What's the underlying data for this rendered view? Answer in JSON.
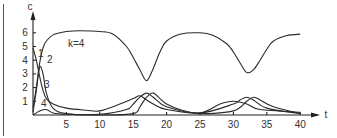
{
  "chart_data": {
    "type": "line",
    "title": "",
    "annotation": "k=4",
    "xlabel": "t",
    "ylabel": "c",
    "xlim": [
      0,
      41
    ],
    "ylim": [
      0,
      6.8
    ],
    "x_ticks": [
      "5",
      "10",
      "15",
      "20",
      "25",
      "30",
      "35",
      "40"
    ],
    "y_ticks": [
      "1",
      "2",
      "3",
      "4",
      "5",
      "6"
    ],
    "grid": false,
    "legend": "none",
    "curve_labels": [
      "1",
      "2",
      "3",
      "4"
    ],
    "series": [
      {
        "name": "curve-1 (dominant)",
        "x": [
          0,
          0.5,
          1,
          1.5,
          2,
          3,
          4,
          5,
          7,
          10,
          12,
          14,
          15,
          16,
          17,
          18,
          19,
          20,
          22,
          25,
          27,
          29,
          30,
          31,
          32,
          33,
          34,
          35,
          36,
          38,
          40
        ],
        "values": [
          0.5,
          2.0,
          3.8,
          4.9,
          5.4,
          5.85,
          6.0,
          6.1,
          6.15,
          6.1,
          5.9,
          5.0,
          4.2,
          3.3,
          2.5,
          3.4,
          4.6,
          5.4,
          5.9,
          6.0,
          5.8,
          5.2,
          4.6,
          3.8,
          3.1,
          3.3,
          4.0,
          4.8,
          5.4,
          5.8,
          5.9
        ]
      },
      {
        "name": "curve-2",
        "x": [
          0,
          0.5,
          1,
          1.5,
          2,
          3,
          5,
          10,
          14,
          15,
          16,
          17,
          18,
          20,
          25,
          30,
          31,
          32,
          33,
          35,
          40
        ],
        "values": [
          0.2,
          1.8,
          3.5,
          3.0,
          1.6,
          0.5,
          0.1,
          0.05,
          0.4,
          0.8,
          1.3,
          1.6,
          1.3,
          0.6,
          0.15,
          0.8,
          1.1,
          1.3,
          1.1,
          0.5,
          0.1
        ]
      },
      {
        "name": "curve-3",
        "x": [
          0,
          0.5,
          1,
          1.5,
          2,
          3,
          5,
          8,
          10,
          13,
          15,
          16,
          17,
          18,
          20,
          25,
          28,
          30,
          32,
          34,
          40
        ],
        "values": [
          4.9,
          4.0,
          2.8,
          1.8,
          1.2,
          0.8,
          0.5,
          0.35,
          0.3,
          0.8,
          1.2,
          1.4,
          1.1,
          0.8,
          0.4,
          0.15,
          0.8,
          1.0,
          0.8,
          0.4,
          0.2
        ]
      },
      {
        "name": "curve-4",
        "x": [
          0,
          1,
          2,
          3,
          5,
          10,
          15,
          16,
          17,
          18,
          19,
          20,
          22,
          25,
          30,
          32,
          33,
          34,
          36,
          40
        ],
        "values": [
          0.0,
          0.3,
          0.4,
          0.15,
          0.05,
          0.0,
          0.1,
          0.6,
          1.3,
          1.6,
          1.2,
          0.8,
          0.4,
          0.1,
          0.3,
          1.0,
          1.3,
          1.1,
          0.6,
          0.1
        ]
      }
    ]
  }
}
